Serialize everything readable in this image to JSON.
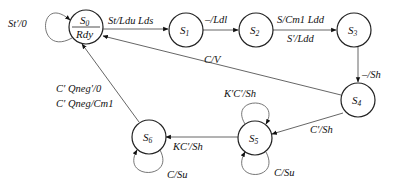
{
  "diagram": {
    "type": "state-machine",
    "states": [
      {
        "id": "S0",
        "name": "S",
        "sub": "0",
        "output": "Rdy",
        "cx": 86,
        "cy": 27
      },
      {
        "id": "S1",
        "name": "S",
        "sub": "1",
        "cx": 186,
        "cy": 30
      },
      {
        "id": "S2",
        "name": "S",
        "sub": "2",
        "cx": 256,
        "cy": 30
      },
      {
        "id": "S3",
        "name": "S",
        "sub": "3",
        "cx": 354,
        "cy": 30
      },
      {
        "id": "S4",
        "name": "S",
        "sub": "4",
        "cx": 358,
        "cy": 100
      },
      {
        "id": "S5",
        "name": "S",
        "sub": "5",
        "cx": 255,
        "cy": 138
      },
      {
        "id": "S6",
        "name": "S",
        "sub": "6",
        "cx": 149,
        "cy": 137
      }
    ],
    "transitions": {
      "s0_self": "St′/0",
      "s0_s1": "St/Ldu Lds",
      "s1_s2": "–/Ldl",
      "s2_s3_a": "S/Cm1 Ldd",
      "s2_s3_b": "S′/Ldd",
      "s3_s4": "–/Sh",
      "s4_s0": "C/V",
      "s4_s5": "C′/Sh",
      "s5_self_top": "K′C′/Sh",
      "s5_self_bottom": "C/Su",
      "s5_s6": "KC′/Sh",
      "s6_self": "C/Su",
      "s6_s0_a": "C′ Qneg′/0",
      "s6_s0_b": "C′ Qneg/Cm1"
    }
  }
}
